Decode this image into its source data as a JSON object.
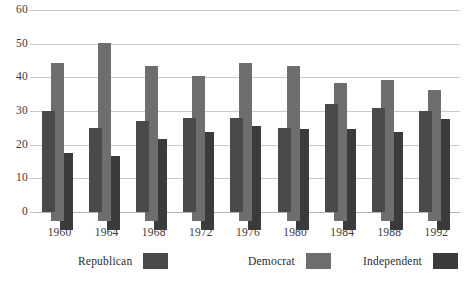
{
  "chart_data": {
    "type": "bar",
    "title": "",
    "subtitle": "",
    "xlabel": "",
    "ylabel": "",
    "ylim": [
      0,
      60
    ],
    "yticks": [
      0,
      10,
      20,
      30,
      40,
      50,
      60
    ],
    "grid": true,
    "legend_position": "bottom",
    "categories": [
      "1960",
      "1964",
      "1968",
      "1972",
      "1976",
      "1980",
      "1984",
      "1988",
      "1992"
    ],
    "series": [
      {
        "name": "Republican",
        "color": "#4a4a4a",
        "values": [
          30,
          25,
          27,
          28,
          28,
          25,
          32,
          31,
          30
        ]
      },
      {
        "name": "Democrat",
        "color": "#6e6e6e",
        "values": [
          47,
          53,
          46,
          43,
          47,
          46,
          41,
          42,
          39
        ]
      },
      {
        "name": "Independent",
        "color": "#3b3b3b",
        "values": [
          23,
          22,
          27,
          29,
          31,
          30,
          30,
          29,
          33
        ]
      }
    ]
  },
  "axis": {
    "y_tick_labels": [
      "0",
      "10",
      "20",
      "30",
      "40",
      "50",
      "60"
    ],
    "x_tick_labels": [
      "1960",
      "1964",
      "1968",
      "1972",
      "1976",
      "1980",
      "1984",
      "1988",
      "1992"
    ]
  },
  "legend": {
    "entries": [
      {
        "label": "Republican",
        "color": "#4a4a4a"
      },
      {
        "label": "Democrat",
        "color": "#6e6e6e"
      },
      {
        "label": "Independent",
        "color": "#3b3b3b"
      }
    ]
  }
}
